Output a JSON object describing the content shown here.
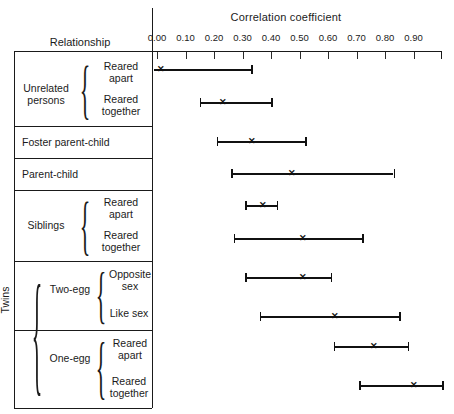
{
  "header": {
    "row_label_header": "Relationship",
    "axis_title": "Correlation coefficient"
  },
  "axis": {
    "ticks": [
      "0.00",
      "0.10",
      "0.20",
      "0.30",
      "0.40",
      "0.50",
      "0.60",
      "0.70",
      "0.80",
      "0.90"
    ],
    "tick_values": [
      0.0,
      0.1,
      0.2,
      0.3,
      0.4,
      0.5,
      0.6,
      0.7,
      0.8,
      0.9
    ]
  },
  "groups": [
    {
      "name": "Unrelated persons",
      "brace": "{",
      "rows": [
        "Reared apart",
        "Reared together"
      ]
    },
    {
      "name": "",
      "brace": "",
      "rows": [
        "Foster parent-child"
      ]
    },
    {
      "name": "",
      "brace": "",
      "rows": [
        "Parent-child"
      ]
    },
    {
      "name": "Siblings",
      "brace": "{",
      "rows": [
        "Reared apart",
        "Reared together"
      ]
    },
    {
      "name": "Two-egg",
      "brace": "{",
      "rows": [
        "Opposite sex",
        "Like sex"
      ]
    },
    {
      "name": "One-egg",
      "brace": "{",
      "rows": [
        "Reared apart",
        "Reared together"
      ]
    }
  ],
  "outer_group": {
    "label": "Twins",
    "brace": "{"
  },
  "chart_data": {
    "type": "line",
    "title": "Correlation coefficient",
    "xlabel": "Correlation coefficient",
    "ylabel": "Relationship",
    "xlim": [
      -0.05,
      1.0
    ],
    "grid": false,
    "legend": "none",
    "marker": "x (median / point estimate)",
    "note": "Horizontal range bars with end caps; x marks the central value.",
    "categories": [
      "Unrelated persons - Reared apart",
      "Unrelated persons - Reared together",
      "Foster parent-child",
      "Parent-child",
      "Siblings - Reared apart",
      "Siblings - Reared together",
      "Twins, Two-egg - Opposite sex",
      "Twins, Two-egg - Like sex",
      "Twins, One-egg - Reared apart",
      "Twins, One-egg - Reared together"
    ],
    "series": [
      {
        "name": "range_low",
        "values": [
          -0.05,
          0.15,
          0.21,
          0.26,
          0.31,
          0.27,
          0.31,
          0.36,
          0.62,
          0.71
        ]
      },
      {
        "name": "median",
        "values": [
          0.01,
          0.23,
          0.33,
          0.47,
          0.37,
          0.51,
          0.51,
          0.62,
          0.76,
          0.9
        ]
      },
      {
        "name": "range_high",
        "values": [
          0.33,
          0.4,
          0.52,
          0.83,
          0.42,
          0.72,
          0.61,
          0.85,
          0.88,
          1.0
        ]
      }
    ]
  }
}
